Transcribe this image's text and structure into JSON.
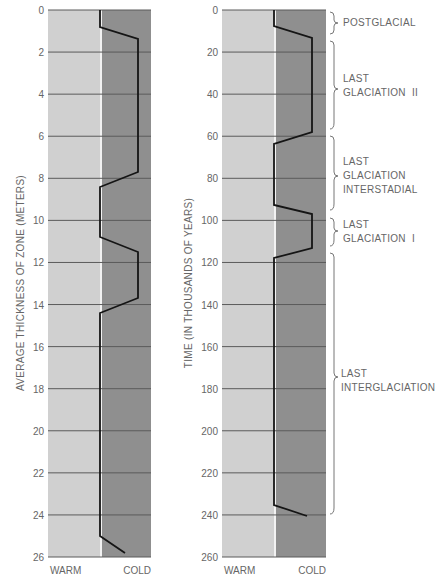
{
  "chart_data": [
    {
      "type": "line",
      "title": "",
      "ylabel": "AVERAGE THICKNESS OF ZONE (METERS)",
      "xlabel_left": "WARM",
      "xlabel_right": "COLD",
      "ylim": [
        0,
        26
      ],
      "y_inverted": true,
      "y_ticks": [
        0,
        2,
        4,
        6,
        8,
        10,
        12,
        14,
        16,
        18,
        20,
        22,
        24,
        26
      ],
      "grid": true,
      "x_scale": "0 = warm boundary, 1 = cold (right edge)",
      "series": [
        {
          "name": "climate curve (thickness)",
          "points": [
            [
              0.0,
              0.8
            ],
            [
              0.74,
              1.4
            ],
            [
              0.74,
              7.7
            ],
            [
              0.0,
              8.4
            ],
            [
              0.0,
              10.8
            ],
            [
              0.74,
              11.5
            ],
            [
              0.74,
              13.7
            ],
            [
              0.0,
              14.4
            ],
            [
              0.0,
              25.0
            ],
            [
              0.48,
              25.8
            ]
          ]
        }
      ]
    },
    {
      "type": "line",
      "title": "",
      "ylabel": "TIME (IN THOUSANDS OF YEARS)",
      "xlabel_left": "WARM",
      "xlabel_right": "COLD",
      "ylim": [
        0,
        260
      ],
      "y_inverted": true,
      "y_ticks": [
        0,
        20,
        40,
        60,
        80,
        100,
        120,
        140,
        160,
        180,
        200,
        220,
        240,
        260
      ],
      "grid": true,
      "series": [
        {
          "name": "climate curve (time)",
          "points": [
            [
              0.0,
              0
            ],
            [
              0.0,
              8
            ],
            [
              0.73,
              14
            ],
            [
              0.73,
              58
            ],
            [
              0.0,
              64
            ],
            [
              0.0,
              93
            ],
            [
              0.73,
              97
            ],
            [
              0.73,
              113
            ],
            [
              0.0,
              118
            ],
            [
              0.0,
              235
            ],
            [
              0.63,
              240
            ]
          ]
        }
      ],
      "annotations": [
        {
          "label": "POSTGLACIAL",
          "range": [
            0,
            12
          ]
        },
        {
          "label": "LAST GLACIATION II",
          "range": [
            14,
            60
          ]
        },
        {
          "label": "LAST GLACIATION INTERSTADIAL",
          "range": [
            62,
            97
          ]
        },
        {
          "label": "LAST GLACIATION I",
          "range": [
            98,
            117
          ]
        },
        {
          "label": "LAST INTERGLACIATION",
          "range": [
            119,
            241
          ]
        }
      ]
    }
  ],
  "colors": {
    "warm_zone": "#cfcfcf",
    "cold_zone": "#8e8e8e",
    "gridline": "#555555",
    "curve": "#1a1a1a",
    "text": "#666666"
  },
  "left_chart": {
    "ylabel": "AVERAGE THICKNESS OF ZONE (METERS)",
    "warm": "WARM",
    "cold": "COLD",
    "ticks": [
      "0",
      "2",
      "4",
      "6",
      "8",
      "10",
      "12",
      "14",
      "16",
      "18",
      "20",
      "22",
      "24",
      "26"
    ]
  },
  "right_chart": {
    "ylabel": "TIME (IN THOUSANDS OF YEARS)",
    "warm": "WARM",
    "cold": "COLD",
    "ticks": [
      "0",
      "20",
      "40",
      "60",
      "80",
      "100",
      "120",
      "140",
      "160",
      "180",
      "200",
      "220",
      "240",
      "260"
    ],
    "annotations": {
      "postglacial": [
        "POSTGLACIAL"
      ],
      "glaciation_ii": [
        "LAST",
        "GLACIATION  II"
      ],
      "interstadial": [
        "LAST",
        "GLACIATION",
        "INTERSTADIAL"
      ],
      "glaciation_i": [
        "LAST",
        "GLACIATION  I"
      ],
      "interglaciation": [
        "LAST",
        "INTERGLACIATION"
      ]
    }
  }
}
